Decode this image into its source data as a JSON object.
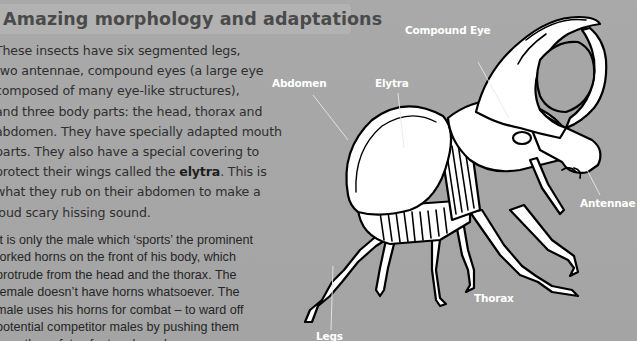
{
  "heading": "Amazing morphology and adaptations",
  "paragraph1": {
    "lines": [
      "These insects have six segmented legs,",
      "two antennae, compound eyes (a large eye",
      "composed of many eye-like structures),",
      "and three body parts: the head, thorax and",
      "abdomen. They have specially adapted mouth",
      "parts. They also have a special covering to"
    ],
    "line7_before": "protect their wings called the ",
    "line7_bold": "elytra",
    "line7_after": ". This is",
    "lines_end": [
      "what they rub on their abdomen to make a",
      "loud scary hissing sound."
    ]
  },
  "paragraph2": {
    "lines": [
      "It is only the male which ‘sports’ the prominent",
      "forked horns on the front of his body, which",
      "protrude from the head and the thorax. The",
      "female doesn’t have horns whatsoever. The",
      "male uses his horns for combat – to ward off",
      "potential competitor males by pushing them",
      "from the safety of a tree branch."
    ]
  },
  "diagram": {
    "labels": {
      "compound_eye": "Compound Eye",
      "abdomen": "Abdomen",
      "elytra": "Elytra",
      "antennae": "Antennae",
      "thorax": "Thorax",
      "legs": "Legs"
    }
  },
  "colors": {
    "background": "#a6a6a6",
    "heading_banner": "#b2b2b2",
    "heading_text": "#4a4a4a",
    "body_text": "#2f2f2f",
    "label_text": "#ffffff",
    "outline": "#000000",
    "fill": "#ffffff"
  }
}
